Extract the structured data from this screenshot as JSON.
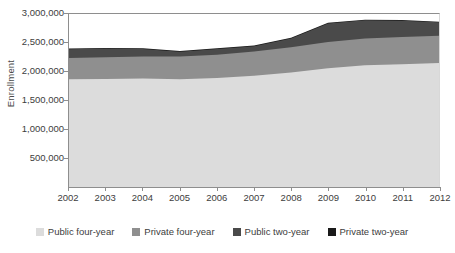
{
  "chart_data": {
    "type": "area",
    "stacked": true,
    "title": "",
    "xlabel": "",
    "ylabel": "Enrollment",
    "x": [
      2002,
      2003,
      2004,
      2005,
      2006,
      2007,
      2008,
      2009,
      2010,
      2011,
      2012
    ],
    "categories": [
      "2002",
      "2003",
      "2004",
      "2005",
      "2006",
      "2007",
      "2008",
      "2009",
      "2010",
      "2011",
      "2012"
    ],
    "ylim": [
      0,
      3000000
    ],
    "ytick_labels": [
      "3,000,000",
      "2,500,000",
      "2,000,000",
      "1,500,000",
      "1,000,000",
      "500,000"
    ],
    "ytick_values": [
      3000000,
      2500000,
      2000000,
      1500000,
      1000000,
      500000
    ],
    "grid": false,
    "legend_position": "bottom",
    "series": [
      {
        "name": "Public four-year",
        "color": "#dcdcdc",
        "values": [
          1870000,
          1875000,
          1880000,
          1870000,
          1890000,
          1930000,
          1985000,
          2060000,
          2110000,
          2130000,
          2150000
        ]
      },
      {
        "name": "Private four-year",
        "color": "#8f8f8f",
        "values": [
          365000,
          375000,
          385000,
          395000,
          405000,
          420000,
          440000,
          455000,
          465000,
          470000,
          475000
        ]
      },
      {
        "name": "Public two-year",
        "color": "#4a4a4a",
        "values": [
          2390000,
          2400000,
          2395000,
          2345000,
          2395000,
          2440000,
          2575000,
          2835000,
          2890000,
          2885000,
          2855000
        ]
      },
      {
        "name": "Private two-year",
        "color": "#1a1a1a",
        "values": [
          2400000,
          2412000,
          2408000,
          2358000,
          2408000,
          2455000,
          2590000,
          2850000,
          2900000,
          2895000,
          2865000
        ]
      }
    ],
    "series_cumulative_note": "Public two-year and Private two-year values are cumulative stack tops"
  },
  "axis": {
    "y_title": "Enrollment",
    "y_ticks": [
      "3,000,000",
      "2,500,000",
      "2,000,000",
      "1,500,000",
      "1,000,000",
      "500,000"
    ],
    "x_ticks": [
      "2002",
      "2003",
      "2004",
      "2005",
      "2006",
      "2007",
      "2008",
      "2009",
      "2010",
      "2011",
      "2012"
    ]
  },
  "legend": {
    "items": [
      {
        "label": "Public four-year",
        "color": "#dcdcdc"
      },
      {
        "label": "Private four-year",
        "color": "#8f8f8f"
      },
      {
        "label": "Public two-year",
        "color": "#4a4a4a"
      },
      {
        "label": "Private two-year",
        "color": "#1a1a1a"
      }
    ]
  }
}
